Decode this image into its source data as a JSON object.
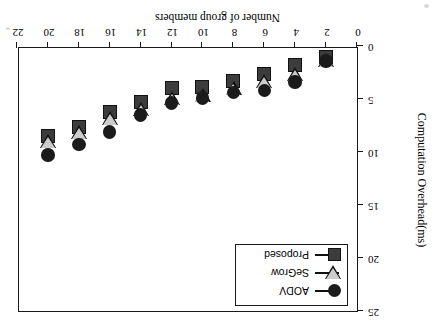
{
  "chart_data": {
    "type": "scatter",
    "title": "",
    "xlabel": "Number of group members",
    "ylabel": "Computation Overhead(ms)",
    "x": [
      2,
      4,
      6,
      8,
      10,
      12,
      14,
      16,
      18,
      20
    ],
    "xlim": [
      0,
      22
    ],
    "ylim": [
      0,
      25
    ],
    "xticks": [
      "0",
      "2",
      "4",
      "6",
      "8",
      "10",
      "12",
      "14",
      "16",
      "18",
      "20",
      "22"
    ],
    "xtick_values": [
      0,
      2,
      4,
      6,
      8,
      10,
      12,
      14,
      16,
      18,
      20,
      22
    ],
    "yticks": [
      "0",
      "5",
      "10",
      "15",
      "20",
      "25"
    ],
    "ytick_values": [
      0,
      5,
      10,
      15,
      20,
      25
    ],
    "grid": false,
    "legend_position": "top-left",
    "orientation_note": "figure rendered rotated 180 degrees (upside-down scan)",
    "series": [
      {
        "name": "AODV",
        "marker": "circle",
        "color": "#1b1b1b",
        "values": [
          1.4,
          3.4,
          4.2,
          4.4,
          4.9,
          5.4,
          6.5,
          8.1,
          9.3,
          10.3
        ]
      },
      {
        "name": "SeGrow",
        "marker": "triangle-down",
        "color": "#cccccc",
        "values": [
          1.3,
          2.6,
          3.3,
          4.0,
          4.6,
          4.9,
          5.9,
          6.8,
          8.1,
          9.0
        ]
      },
      {
        "name": "Proposed",
        "marker": "square",
        "color": "#3c3c3c",
        "values": [
          1.0,
          1.8,
          2.6,
          3.3,
          3.9,
          4.0,
          5.3,
          6.2,
          7.6,
          8.5
        ]
      }
    ]
  },
  "legend": {
    "items": [
      {
        "label": "AODV",
        "marker": "circle"
      },
      {
        "label": "SeGrow",
        "marker": "triangle-down"
      },
      {
        "label": "Proposed",
        "marker": "square"
      }
    ]
  },
  "axes": {
    "x_title": "Number of group members",
    "y_title": "Computation Overhead(ms)"
  }
}
